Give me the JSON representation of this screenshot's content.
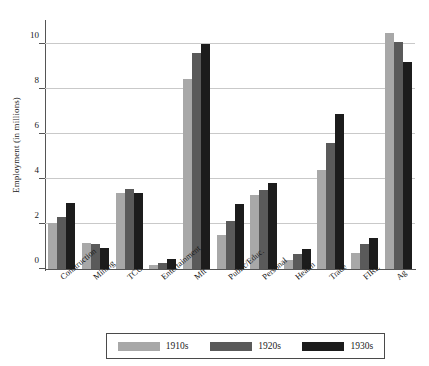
{
  "chart_data": {
    "type": "bar",
    "title": "",
    "xlabel": "",
    "ylabel": "Employment (in millions)",
    "ylim": [
      0,
      11
    ],
    "yticks": [
      0,
      2,
      4,
      6,
      8,
      10
    ],
    "ytick_labels": [
      "0",
      "2",
      "4",
      "6",
      "8",
      "10"
    ],
    "grid": true,
    "legend_position": "bottom",
    "categories": [
      "Construction",
      "Mining",
      "TCU",
      "Entertainment",
      "Mft",
      "Public/Educ.",
      "Personal",
      "Health",
      "Trade",
      "FIRE",
      "Ag"
    ],
    "series": [
      {
        "name": "1910s",
        "color": "#a8a8a8",
        "values": [
          2.05,
          1.15,
          3.4,
          0.2,
          8.45,
          1.5,
          3.3,
          0.4,
          4.4,
          0.7,
          10.5
        ]
      },
      {
        "name": "1920s",
        "color": "#5a5a5a",
        "values": [
          2.3,
          1.1,
          3.55,
          0.25,
          9.6,
          2.15,
          3.5,
          0.65,
          5.6,
          1.1,
          10.1
        ]
      },
      {
        "name": "1930s",
        "color": "#1c1c1c",
        "values": [
          2.95,
          0.95,
          3.4,
          0.45,
          10.0,
          2.9,
          3.85,
          0.9,
          6.9,
          1.4,
          9.2
        ]
      }
    ]
  },
  "axes": {
    "y_axis_title": "Employment (in millions)"
  },
  "legend": {
    "entries": [
      {
        "label": "1910s",
        "color": "#a8a8a8"
      },
      {
        "label": "1920s",
        "color": "#5a5a5a"
      },
      {
        "label": "1930s",
        "color": "#1c1c1c"
      }
    ]
  }
}
